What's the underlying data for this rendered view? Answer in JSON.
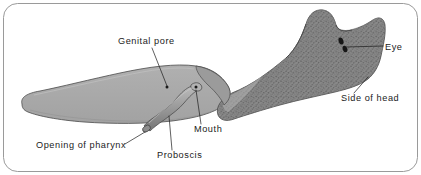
{
  "figure": {
    "frame_color": "#9a9a9a",
    "background_color": "#ffffff"
  },
  "specimen": {
    "body_fill": "#a9a9a9",
    "head_fill": "#8c8c8c",
    "head_texture": "stipple",
    "outline_color": "#4a4a4a",
    "proboscis_fill": "#9d9d9d",
    "eye_color": "#171717"
  },
  "labels": [
    {
      "id": "genital-pore",
      "text": "Genital pore",
      "text_x": 118,
      "text_y": 44,
      "anchor": "start",
      "leader": "M 152,48 L 167,86"
    },
    {
      "id": "eye",
      "text": "Eye",
      "text_x": 385,
      "text_y": 50,
      "anchor": "start",
      "leader": "M 383,46 L 350,46"
    },
    {
      "id": "side-of-head",
      "text": "Side of head",
      "text_x": 341,
      "text_y": 101,
      "anchor": "start",
      "leader": "M 354,93 L 366,79"
    },
    {
      "id": "mouth",
      "text": "Mouth",
      "text_x": 194,
      "text_y": 132,
      "anchor": "start",
      "leader": "M 201,124 L 196,91"
    },
    {
      "id": "proboscis",
      "text": "Proboscis",
      "text_x": 157,
      "text_y": 158,
      "anchor": "start",
      "leader": "M 172,150 L 169,116"
    },
    {
      "id": "opening-of-pharynx",
      "text": "Opening of pharynx",
      "text_x": 36,
      "text_y": 148,
      "anchor": "start",
      "leader": "M 125,144 L 148,132"
    }
  ],
  "eyes": [
    {
      "cx": 341,
      "cy": 41,
      "rx": 2.4,
      "ry": 3.6,
      "rot": -18
    },
    {
      "cx": 345,
      "cy": 49,
      "rx": 2.3,
      "ry": 3.4,
      "rot": -18
    }
  ]
}
